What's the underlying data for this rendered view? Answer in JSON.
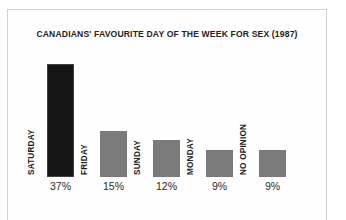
{
  "figure": {
    "background_color": "#ffffff",
    "frame_color": "#d2d2d2"
  },
  "chart_data": {
    "type": "bar",
    "title": "CANADIANS' FAVOURITE DAY OF THE WEEK FOR SEX (1987)",
    "xlabel": "",
    "ylabel": "",
    "ylim": [
      0,
      40
    ],
    "grid": false,
    "legend": false,
    "orientation": "vertical",
    "categories": [
      "SATURDAY",
      "FRIDAY",
      "SUNDAY",
      "MONDAY",
      "NO OPINION"
    ],
    "values": [
      37,
      15,
      12,
      9,
      9
    ],
    "value_labels": [
      "37%",
      "15%",
      "12%",
      "9%",
      "9%"
    ],
    "bar_colors": [
      "#151515",
      "#7b7b7b",
      "#7b7b7b",
      "#7b7b7b",
      "#7b7b7b"
    ],
    "highlight_category": "SATURDAY",
    "units": "percent"
  }
}
